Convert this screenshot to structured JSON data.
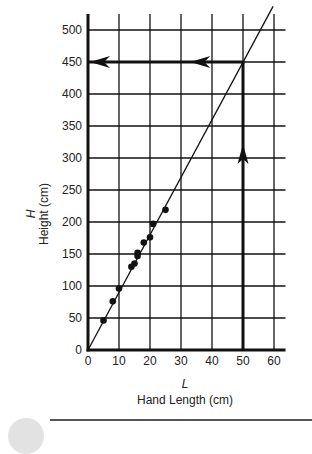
{
  "chart_data": {
    "type": "scatter",
    "title": "",
    "xlabel_var": "L",
    "xlabel": "Hand Length (cm)",
    "ylabel_var": "H",
    "ylabel": "Height (cm)",
    "xlim": [
      0,
      65
    ],
    "ylim": [
      0,
      520
    ],
    "x_ticks": [
      0,
      10,
      20,
      30,
      40,
      50,
      60
    ],
    "y_ticks": [
      0,
      50,
      100,
      150,
      200,
      250,
      300,
      350,
      400,
      450,
      500
    ],
    "grid": true,
    "legend": null,
    "series": [
      {
        "name": "measurements",
        "type": "scatter",
        "points": [
          {
            "x": 5,
            "y": 46
          },
          {
            "x": 8,
            "y": 76
          },
          {
            "x": 10,
            "y": 96
          },
          {
            "x": 14,
            "y": 130
          },
          {
            "x": 15,
            "y": 135
          },
          {
            "x": 16,
            "y": 147
          },
          {
            "x": 16,
            "y": 152
          },
          {
            "x": 18,
            "y": 168
          },
          {
            "x": 20,
            "y": 176
          },
          {
            "x": 21,
            "y": 197
          },
          {
            "x": 25,
            "y": 219
          }
        ]
      },
      {
        "name": "best-fit line",
        "type": "line",
        "points": [
          {
            "x": 0,
            "y": 0
          },
          {
            "x": 59.7,
            "y": 537
          }
        ]
      }
    ],
    "annotations": [
      {
        "type": "arrow-up",
        "x": 50,
        "from_y": 0,
        "to_y": 450,
        "arrowhead_at_y": 300
      },
      {
        "type": "arrow-left",
        "y": 450,
        "from_x": 50,
        "to_x": 0,
        "arrowheads_at_x": [
          33,
          0
        ]
      }
    ]
  },
  "plot": {
    "x_tick_labels": [
      "0",
      "10",
      "20",
      "30",
      "40",
      "50",
      "60"
    ],
    "y_tick_labels": [
      "0",
      "50",
      "100",
      "150",
      "200",
      "250",
      "300",
      "350",
      "400",
      "450",
      "500"
    ],
    "x_var": "L",
    "x_name": "Hand Length (cm)",
    "y_var": "H",
    "y_name": "Height (cm)"
  },
  "colors": {
    "ink": "#111111",
    "text": "#222222",
    "background": "#ffffff",
    "rule": "#555555",
    "circle": "#e2e2e2"
  }
}
